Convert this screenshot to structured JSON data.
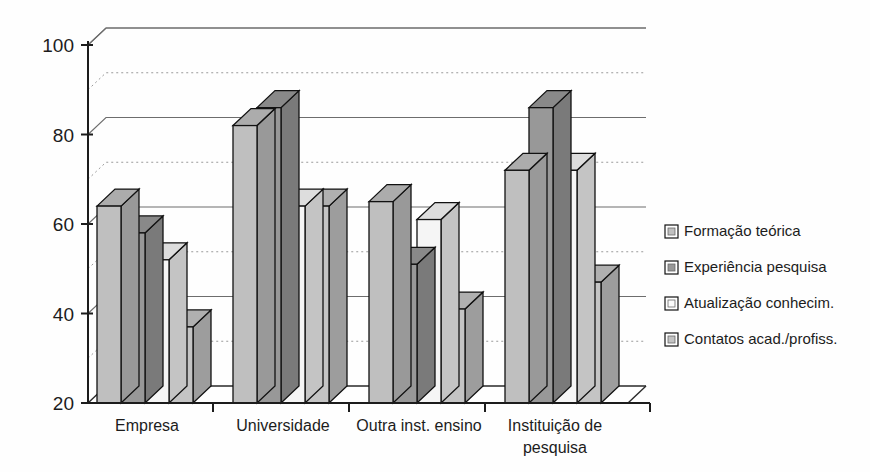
{
  "chart_data": {
    "type": "bar",
    "title": "",
    "subtitle": "",
    "xlabel": "",
    "ylabel": "",
    "ylim": [
      20,
      100
    ],
    "ytick_values": [
      20,
      40,
      60,
      80,
      100
    ],
    "ytick_labels": [
      "20",
      "40",
      "60",
      "80",
      "100"
    ],
    "minor_gridlines": [
      30,
      50,
      70,
      90
    ],
    "grid": true,
    "legend_position": "right",
    "style": "3d-grouped-bars",
    "categories": [
      "Empresa",
      "Universidade",
      "Outra inst. ensino",
      "Instituição de pesquisa"
    ],
    "series": [
      {
        "name": "Formação teórica",
        "color": "#bfbfbf",
        "values": [
          64,
          82,
          65,
          72
        ]
      },
      {
        "name": "Experiência pesquisa",
        "color": "#989898",
        "values": [
          58,
          86,
          51,
          86
        ]
      },
      {
        "name": "Atualização conhecim.",
        "color": "#f5f5f5",
        "values": [
          52,
          64,
          61,
          72
        ]
      },
      {
        "name": "Contatos acad./profiss.",
        "color": "#c4c4c4",
        "values": [
          37,
          64,
          41,
          47
        ]
      }
    ]
  },
  "axis": {
    "y_ticks": [
      {
        "label": "100",
        "value": 100
      },
      {
        "label": "80",
        "value": 80
      },
      {
        "label": "60",
        "value": 60
      },
      {
        "label": "40",
        "value": 40
      },
      {
        "label": "20",
        "value": 20
      }
    ],
    "categories": [
      {
        "line1": "Empresa",
        "line2": ""
      },
      {
        "line1": "Universidade",
        "line2": ""
      },
      {
        "line1": "Outra inst. ensino",
        "line2": ""
      },
      {
        "line1": "Instituição de",
        "line2": "pesquisa"
      }
    ]
  },
  "legend": {
    "items": [
      {
        "label": "Formação teórica",
        "color": "#bfbfbf"
      },
      {
        "label": "Experiência pesquisa",
        "color": "#989898"
      },
      {
        "label": "Atualização conhecim.",
        "color": "#fbfbfb"
      },
      {
        "label": "Contatos acad./profiss.",
        "color": "#c4c4c4"
      }
    ]
  }
}
